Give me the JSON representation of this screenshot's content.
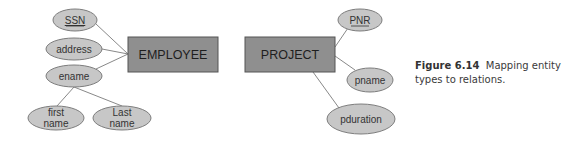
{
  "diagram": {
    "type": "ER diagram",
    "entities": [
      {
        "id": "employee",
        "label": "EMPLOYEE"
      },
      {
        "id": "project",
        "label": "PROJECT"
      }
    ],
    "attributes": {
      "ssn": {
        "label": "SSN",
        "key": true,
        "entity": "employee"
      },
      "address": {
        "label": "address",
        "key": false,
        "entity": "employee"
      },
      "ename": {
        "label": "ename",
        "key": false,
        "entity": "employee",
        "composite": true
      },
      "first_name": {
        "line1": "first",
        "line2": "name",
        "parent": "ename"
      },
      "last_name": {
        "line1": "Last",
        "line2": "name",
        "parent": "ename"
      },
      "pnr": {
        "label": "PNR",
        "key": true,
        "entity": "project"
      },
      "pname": {
        "label": "pname",
        "key": false,
        "entity": "project"
      },
      "pduration": {
        "label": "pduration",
        "key": false,
        "entity": "project"
      }
    },
    "colors": {
      "entity_fill": "#8f8f8f",
      "attribute_fill": "#c7c7c7",
      "line": "#7a7a7a"
    }
  },
  "caption": {
    "figure_label": "Figure 6.14",
    "text": "Mapping entity types to relations."
  }
}
